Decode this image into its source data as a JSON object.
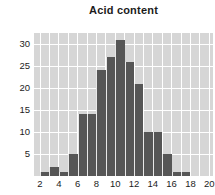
{
  "title": "Acid content",
  "colors": {
    "page_bg": "#ffffff",
    "plot_bg": "#d6d6d6",
    "bar": "#565656",
    "grid": "#ffffff",
    "text": "#1c1c1c"
  },
  "chart_data": {
    "type": "bar",
    "subtype": "histogram",
    "title": "Acid content",
    "xlabel": "",
    "ylabel": "",
    "bin_width": 1,
    "bin_starts": [
      2,
      3,
      4,
      5,
      6,
      7,
      8,
      9,
      10,
      11,
      12,
      13,
      14,
      15,
      16,
      17
    ],
    "values": [
      1,
      2,
      1,
      5,
      14,
      14,
      24,
      27,
      31,
      26,
      21,
      10,
      10,
      5,
      1,
      1
    ],
    "x_ticks": [
      2,
      4,
      6,
      8,
      10,
      12,
      14,
      16,
      18,
      20
    ],
    "y_ticks": [
      5,
      10,
      15,
      20,
      25,
      30
    ],
    "xlim": [
      1.36,
      20.4
    ],
    "ylim": [
      0,
      32.5
    ],
    "grid": {
      "vertical_every": 1,
      "horizontal_every": 5,
      "style": "white lines on gray panel"
    },
    "legend": "none"
  }
}
